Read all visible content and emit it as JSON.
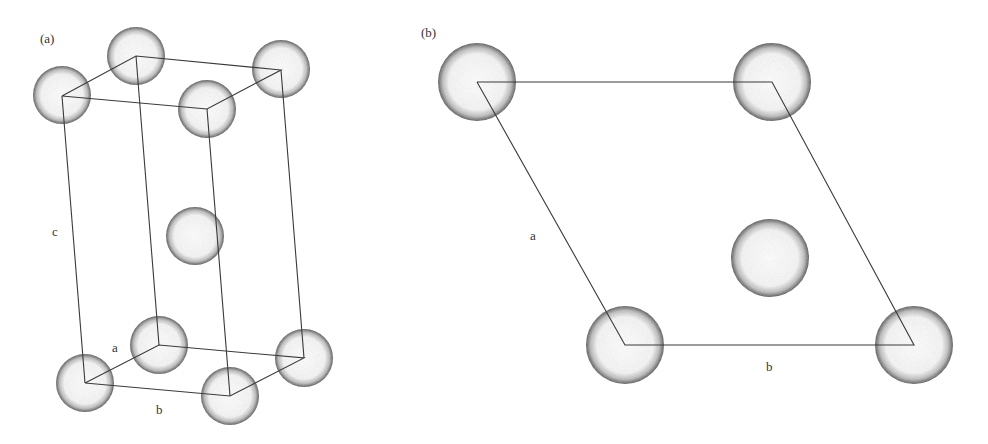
{
  "panels": [
    {
      "id": "a",
      "label": "(a)",
      "axis_labels": {
        "a": "a",
        "b": "b",
        "c": "c"
      },
      "description": "3D unit cell (hexagonal close-packed) with atoms at 8 corners and one interior atom",
      "atoms": [
        {
          "cx": 136,
          "cy": 56,
          "r": 29
        },
        {
          "cx": 62,
          "cy": 95,
          "r": 29
        },
        {
          "cx": 281,
          "cy": 69,
          "r": 29
        },
        {
          "cx": 207,
          "cy": 109,
          "r": 29
        },
        {
          "cx": 195,
          "cy": 236,
          "r": 29
        },
        {
          "cx": 159,
          "cy": 345,
          "r": 29
        },
        {
          "cx": 85,
          "cy": 383,
          "r": 29
        },
        {
          "cx": 304,
          "cy": 358,
          "r": 29
        },
        {
          "cx": 230,
          "cy": 396,
          "r": 29
        }
      ]
    },
    {
      "id": "b",
      "label": "(b)",
      "axis_labels": {
        "a": "a",
        "b": "b"
      },
      "description": "Top view: rhombic base of the cell with atoms at 4 corners and one interior atom",
      "atoms": [
        {
          "cx": 477,
          "cy": 82,
          "r": 39
        },
        {
          "cx": 772,
          "cy": 82,
          "r": 39
        },
        {
          "cx": 770,
          "cy": 258,
          "r": 39
        },
        {
          "cx": 625,
          "cy": 345,
          "r": 39
        },
        {
          "cx": 914,
          "cy": 345,
          "r": 39
        }
      ]
    }
  ],
  "colors": {
    "line": "#3a3a3a",
    "atom_edge": "#555555",
    "background": "#ffffff"
  }
}
